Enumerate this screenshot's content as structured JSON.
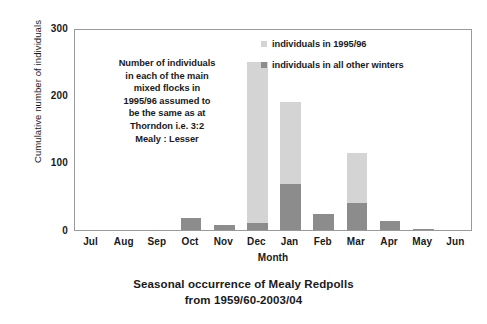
{
  "chart_data": {
    "type": "bar",
    "title": "",
    "caption_line1": "Seasonal occurrence of Mealy Redpolls",
    "caption_line2": "from 1959/60-2003/04",
    "xlabel": "Month",
    "ylabel": "Cumulative number of individuals",
    "categories": [
      "Jul",
      "Aug",
      "Sep",
      "Oct",
      "Nov",
      "Dec",
      "Jan",
      "Feb",
      "Mar",
      "Apr",
      "May",
      "Jun"
    ],
    "ylim": [
      0,
      300
    ],
    "yticks": [
      0,
      100,
      200,
      300
    ],
    "grid": false,
    "stacked": true,
    "legend_position": "top-right",
    "series": [
      {
        "name": "individuals in all other winters",
        "color": "#8c8c8c",
        "values": [
          0,
          0,
          0,
          18,
          8,
          10,
          68,
          24,
          40,
          14,
          2,
          0
        ]
      },
      {
        "name": "individuals in 1995/96",
        "color": "#d4d4d4",
        "values": [
          0,
          0,
          0,
          0,
          0,
          240,
          122,
          0,
          75,
          0,
          0,
          0
        ]
      }
    ],
    "totals": [
      0,
      0,
      0,
      18,
      8,
      250,
      190,
      24,
      115,
      14,
      2,
      0
    ],
    "annotations": [
      {
        "name": "flock-assumption-note",
        "text": "Number of individuals in each of the main mixed flocks in 1995/96 assumed to be the same as at Thorndon i.e. 3:2 Mealy : Lesser",
        "lines": [
          "Number of individuals",
          "in each of the main",
          "mixed flocks in",
          "1995/96 assumed to",
          "be the same as at",
          "Thorndon i.e. 3:2",
          "Mealy : Lesser"
        ]
      }
    ]
  }
}
